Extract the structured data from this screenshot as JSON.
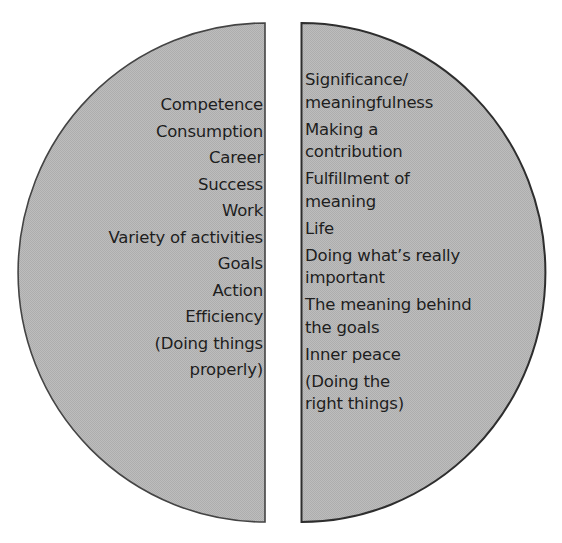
{
  "diagram": {
    "type": "split-circle-comparison",
    "colors": {
      "fill": "#b9b9b9",
      "stroke": "#3a3a3a",
      "text": "#1e1e1e",
      "background": "#ffffff"
    },
    "left_half": {
      "items": [
        {
          "label": "Competence"
        },
        {
          "label": "Consumption"
        },
        {
          "label": "Career"
        },
        {
          "label": "Success"
        },
        {
          "label": "Work"
        },
        {
          "label": "Variety of activities"
        },
        {
          "label": "Goals"
        },
        {
          "label": "Action"
        },
        {
          "label": "Efficiency"
        },
        {
          "label": "(Doing things\nproperly)"
        }
      ]
    },
    "right_half": {
      "items": [
        {
          "label": "Significance/\nmeaningfulness"
        },
        {
          "label": "Making a\ncontribution"
        },
        {
          "label": "Fulfillment of\nmeaning"
        },
        {
          "label": "Life"
        },
        {
          "label": "Doing what’s really\nimportant"
        },
        {
          "label": "The meaning behind\nthe goals"
        },
        {
          "label": "Inner peace"
        },
        {
          "label": "(Doing the\nright things)"
        }
      ]
    }
  }
}
